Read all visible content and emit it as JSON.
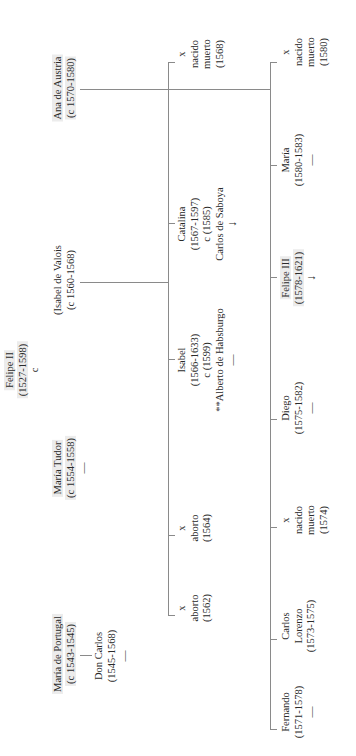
{
  "root": {
    "name": "Felipe II",
    "dates": "(1527-1598)",
    "marriage_marker": "c"
  },
  "spouses": [
    {
      "name": "María de Portugal",
      "dates": "(c 1543-1545)"
    },
    {
      "name": "María Tudor",
      "dates": "(c 1554-1558)",
      "issue": "—"
    },
    {
      "name": "(Isabel de Valois",
      "dates": "(c 1560-1568)"
    },
    {
      "name": "Ana de Austria",
      "dates": "(c 1570-1580)"
    }
  ],
  "children_portugal": [
    {
      "name": "Don Carlos",
      "dates": "(1545-1568)",
      "issue": "—"
    }
  ],
  "children_valois": [
    {
      "mark": "x",
      "name": "aborto",
      "dates": "(1562)"
    },
    {
      "mark": "x",
      "name": "aborto",
      "dates": "(1564)"
    },
    {
      "name": "Isabel",
      "dates": "(1566-1633)",
      "marriage": "c (1599)",
      "spouse": "**Alberto de Habsburgo",
      "issue": "—"
    },
    {
      "name": "Catalina",
      "dates": "(1567-1597)",
      "marriage": "c (1585)",
      "spouse": "Carlos de Saboya",
      "issue": "↓"
    },
    {
      "mark": "x",
      "name": "nacido",
      "name2": "muerto",
      "dates": "(1568)"
    }
  ],
  "children_austria": [
    {
      "name": "Fernando",
      "dates": "(1571-1578)",
      "issue": "—"
    },
    {
      "name": "Carlos",
      "name2": "Lorenzo",
      "dates": "(1573-1575)"
    },
    {
      "mark": "x",
      "name": "nacido",
      "name2": "muerto",
      "dates": "(1574)"
    },
    {
      "name": "Diego",
      "dates": "(1575-1582)",
      "issue": "—"
    },
    {
      "name": "Felipe III",
      "dates": "(1578-1621)",
      "issue": "↓"
    },
    {
      "name": "María",
      "dates": "(1580-1583)",
      "issue": "—"
    },
    {
      "mark": "x",
      "name": "nacido",
      "name2": "muerto",
      "dates": "(1580)"
    }
  ]
}
